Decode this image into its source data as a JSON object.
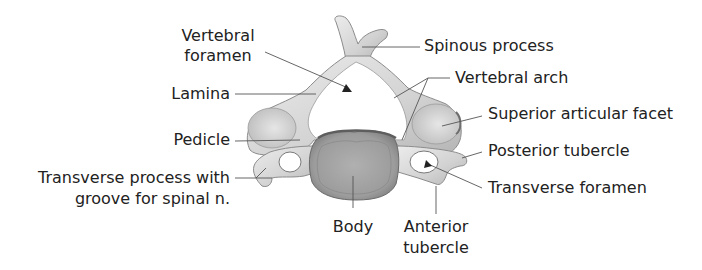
{
  "figure": {
    "colors": {
      "bone_light": "#e4e4e4",
      "bone_mid": "#c9c9c9",
      "bone_dark": "#8e8e8e",
      "body_fill": "#a8a8a8",
      "leader_line": "#555555",
      "text": "#222222",
      "background": "#ffffff"
    },
    "labels": {
      "vertebral_foramen_1": "Vertebral",
      "vertebral_foramen_2": "foramen",
      "lamina": "Lamina",
      "pedicle": "Pedicle",
      "transverse_process_1": "Transverse process with",
      "transverse_process_2": "groove for spinal n.",
      "spinous_process": "Spinous process",
      "vertebral_arch": "Vertebral arch",
      "superior_articular_facet": "Superior articular facet",
      "posterior_tubercle": "Posterior tubercle",
      "transverse_foramen": "Transverse foramen",
      "body": "Body",
      "anterior_tubercle_1": "Anterior",
      "anterior_tubercle_2": "tubercle"
    }
  }
}
